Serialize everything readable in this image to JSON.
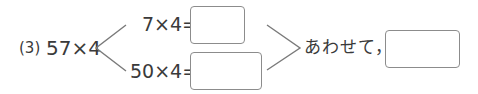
{
  "problem": {
    "number_label": "(3)",
    "expression": "57×4",
    "parts": [
      {
        "expression": "7×4=",
        "answer": ""
      },
      {
        "expression": "50×4=",
        "answer": ""
      }
    ],
    "combine_label": "あわせて，",
    "total_answer": ""
  },
  "colors": {
    "text": "#3a3a3a",
    "box_border": "#8c8c8c",
    "bracket": "#7a7a7a"
  }
}
